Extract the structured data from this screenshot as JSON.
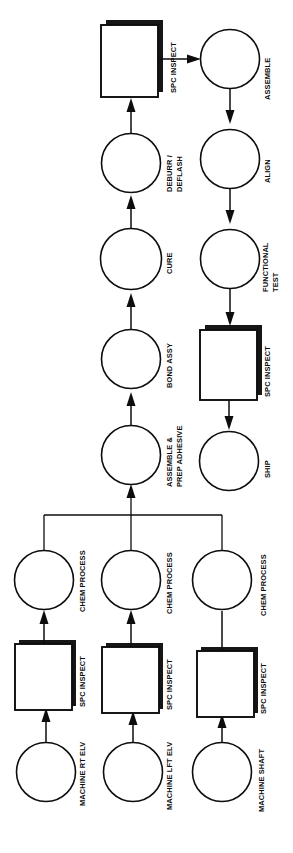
{
  "diagram": {
    "orientation": "rotated-90-ccw",
    "colors": {
      "stroke": "#0d0d0d",
      "fill": "#ffffff",
      "shadow": "#161616",
      "background": "#ffffff"
    },
    "nodes": [
      {
        "id": "machine-rt-elv",
        "label": "MACHINE RT ELV",
        "shape": "circle"
      },
      {
        "id": "spc-inspect-1",
        "label": "SPC INSPECT",
        "shape": "box"
      },
      {
        "id": "chem-process-1",
        "label": "CHEM PROCESS",
        "shape": "circle"
      },
      {
        "id": "machine-lft-elv",
        "label": "MACHINE LFT ELV",
        "shape": "circle"
      },
      {
        "id": "spc-inspect-2",
        "label": "SPC INSPECT",
        "shape": "box"
      },
      {
        "id": "chem-process-2",
        "label": "CHEM PROCESS",
        "shape": "circle"
      },
      {
        "id": "machine-shaft",
        "label": "MACHINE SHAFT",
        "shape": "circle"
      },
      {
        "id": "spc-inspect-3",
        "label": "SPC INSPECT",
        "shape": "box"
      },
      {
        "id": "chem-process-3",
        "label": "CHEM PROCESS",
        "shape": "circle"
      },
      {
        "id": "assemble-prep-adhesive",
        "label": "ASSEMBLE &",
        "label2": "PREP ADHESIVE",
        "shape": "circle"
      },
      {
        "id": "bond-assy",
        "label": "BOND ASSY",
        "shape": "circle"
      },
      {
        "id": "cure",
        "label": "CURE",
        "shape": "circle"
      },
      {
        "id": "deburr-deflash",
        "label": "DEBURR /",
        "label2": "DEFLASH",
        "shape": "circle"
      },
      {
        "id": "spc-inspect-4",
        "label": "SPC INSPECT",
        "shape": "box"
      },
      {
        "id": "assemble",
        "label": "ASSEMBLE",
        "shape": "circle"
      },
      {
        "id": "align",
        "label": "ALIGN",
        "shape": "circle"
      },
      {
        "id": "functional-test",
        "label": "FUNCTIONAL",
        "label2": "TEST",
        "shape": "circle"
      },
      {
        "id": "spc-inspect-5",
        "label": "SPC INSPECT",
        "shape": "box"
      },
      {
        "id": "ship",
        "label": "SHIP",
        "shape": "circle"
      }
    ],
    "labels": {
      "machine_rt_elv": "MACHINE RT ELV",
      "machine_lft_elv": "MACHINE LFT ELV",
      "machine_shaft": "MACHINE SHAFT",
      "spc_inspect_1": "SPC INSPECT",
      "spc_inspect_2": "SPC INSPECT",
      "spc_inspect_3": "SPC INSPECT",
      "spc_inspect_4": "SPC INSPECT",
      "spc_inspect_5": "SPC INSPECT",
      "chem_process_1": "CHEM PROCESS",
      "chem_process_2": "CHEM PROCESS",
      "chem_process_3": "CHEM PROCESS",
      "assemble_prep_1": "ASSEMBLE &",
      "assemble_prep_2": "PREP ADHESIVE",
      "bond_assy": "BOND ASSY",
      "cure": "CURE",
      "deburr_1": "DEBURR /",
      "deburr_2": "DEFLASH",
      "assemble": "ASSEMBLE",
      "align": "ALIGN",
      "functional_test_1": "FUNCTIONAL",
      "functional_test_2": "TEST",
      "ship": "SHIP"
    }
  }
}
